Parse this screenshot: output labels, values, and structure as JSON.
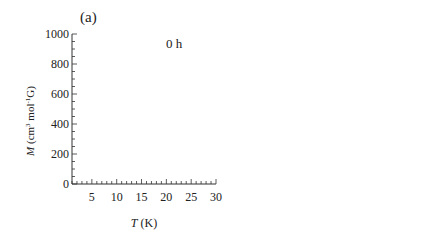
{
  "figure": {
    "panels": [
      {
        "label": "(a)",
        "annotation": "0 h",
        "ylabel": "M (cm3 mol-1 G)",
        "xlabel": "T (K)",
        "arrows": [
          {
            "text": "5 K",
            "x": 5
          },
          {
            "text": "22 K",
            "x": 22
          }
        ]
      },
      {
        "label": "(b)",
        "annotation": "4 h",
        "ylabel": "M (cm3 mol-1 G)",
        "xlabel": "T (K)",
        "field": "H = 30 Oe"
      }
    ],
    "legend": [
      {
        "marker": "circle",
        "label": "FCM"
      },
      {
        "marker": "square",
        "label": "RM"
      },
      {
        "marker": "triangle",
        "label": "ZFCM"
      }
    ],
    "yticks": [
      "0",
      "200",
      "400",
      "600",
      "800",
      "1000"
    ],
    "xticks": [
      "5",
      "10",
      "15",
      "20",
      "25",
      "30"
    ]
  },
  "chart_data": [
    {
      "type": "scatter",
      "title": "(a) 0 h",
      "xlabel": "T (K)",
      "ylabel": "M (cm^3 mol^-1 G)",
      "xlim": [
        1,
        30
      ],
      "ylim": [
        0,
        1000
      ],
      "x": [
        2,
        3,
        4,
        5,
        6,
        8,
        10,
        12,
        14,
        16,
        18,
        20,
        22,
        24,
        26,
        28,
        30
      ],
      "series": [
        {
          "name": "FCM",
          "marker": "circle",
          "values": [
            840,
            830,
            780,
            600,
            530,
            500,
            480,
            460,
            420,
            360,
            280,
            200,
            140,
            80,
            40,
            20,
            10
          ]
        },
        {
          "name": "RM",
          "marker": "square",
          "values": [
            650,
            640,
            600,
            450,
            440,
            430,
            420,
            400,
            360,
            300,
            220,
            160,
            110,
            60,
            30,
            15,
            10
          ]
        },
        {
          "name": "ZFCM",
          "marker": "triangle",
          "values": [
            60,
            100,
            170,
            190,
            110,
            70,
            70,
            100,
            150,
            190,
            180,
            160,
            120,
            70,
            35,
            15,
            10
          ]
        }
      ],
      "annotations": [
        "0 h",
        "5 K",
        "22 K"
      ]
    },
    {
      "type": "scatter",
      "title": "(b) 4 h",
      "xlabel": "T (K)",
      "ylabel": "M (cm^3 mol^-1 G)",
      "xlim": [
        1,
        30
      ],
      "ylim": [
        0,
        1000
      ],
      "x": [
        2,
        3,
        4,
        5,
        6,
        8,
        10,
        12,
        14,
        16,
        18,
        20,
        22,
        24,
        26,
        28,
        30
      ],
      "series": [
        {
          "name": "FCM",
          "marker": "circle",
          "values": [
            590,
            590,
            585,
            580,
            570,
            550,
            520,
            490,
            440,
            370,
            280,
            190,
            120,
            60,
            30,
            15,
            10
          ]
        },
        {
          "name": "RM",
          "marker": "square",
          "values": [
            580,
            580,
            575,
            565,
            550,
            520,
            490,
            450,
            380,
            270,
            150,
            90,
            50,
            25,
            15,
            10,
            5
          ]
        },
        {
          "name": "ZFCM",
          "marker": "triangle",
          "values": [
            30,
            40,
            55,
            70,
            85,
            110,
            130,
            150,
            175,
            205,
            210,
            170,
            110,
            60,
            30,
            15,
            10
          ]
        }
      ],
      "annotations": [
        "4 h",
        "H = 30 Oe"
      ]
    }
  ]
}
